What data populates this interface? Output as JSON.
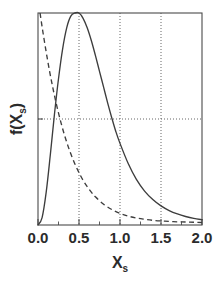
{
  "figure": {
    "background_color": "#ffffff",
    "line_color": "#3d3d3d",
    "grid_color": "#555555"
  },
  "axes": {
    "x_title_main": "X",
    "x_title_sub": "s",
    "y_title_prefix": "f(X",
    "y_title_sub": "s",
    "y_title_suffix": ")",
    "x_tick_labels": [
      "0.0",
      "0.5",
      "1.0",
      "1.5",
      "2.0"
    ],
    "x_tick_values": [
      0.0,
      0.5,
      1.0,
      1.5,
      2.0
    ],
    "y_tick_labels": []
  },
  "chart_data": {
    "type": "line",
    "title": "",
    "xlabel": "X_s",
    "ylabel": "f(X_s)",
    "xlim": [
      0.0,
      2.0
    ],
    "ylim": [
      0.0,
      1.0
    ],
    "grid": true,
    "grid_x_values": [
      0.5,
      1.0,
      1.5
    ],
    "grid_y_values": [
      0.5
    ],
    "legend": "none",
    "x_tick_labels": [
      "0.0",
      "0.5",
      "1.0",
      "1.5",
      "2.0"
    ],
    "y_tick_labels": [],
    "annotations": [],
    "series": [
      {
        "name": "solid-curve",
        "style": "solid",
        "description": "unimodal skewed distribution peaking at X_s = 0.5",
        "x": [
          0.0,
          0.05,
          0.1,
          0.15,
          0.2,
          0.25,
          0.3,
          0.35,
          0.4,
          0.45,
          0.5,
          0.55,
          0.6,
          0.65,
          0.7,
          0.75,
          0.8,
          0.85,
          0.9,
          0.95,
          1.0,
          1.1,
          1.2,
          1.3,
          1.4,
          1.5,
          1.6,
          1.7,
          1.8,
          1.9,
          2.0
        ],
        "y": [
          0.0,
          0.035,
          0.155,
          0.33,
          0.52,
          0.69,
          0.83,
          0.93,
          0.985,
          1.0,
          1.0,
          0.975,
          0.93,
          0.87,
          0.8,
          0.725,
          0.65,
          0.575,
          0.505,
          0.44,
          0.385,
          0.29,
          0.215,
          0.16,
          0.12,
          0.09,
          0.068,
          0.052,
          0.04,
          0.031,
          0.025
        ]
      },
      {
        "name": "dashed-curve",
        "style": "dashed",
        "description": "monotonically decaying exponential-like curve from upper left",
        "x": [
          0.025,
          0.05,
          0.08,
          0.11,
          0.14,
          0.17,
          0.2,
          0.24,
          0.28,
          0.32,
          0.36,
          0.4,
          0.45,
          0.5,
          0.55,
          0.6,
          0.65,
          0.7,
          0.8,
          0.9,
          1.0,
          1.1,
          1.2,
          1.3,
          1.4,
          1.5,
          1.6,
          1.7,
          1.8,
          1.9,
          2.0
        ],
        "y": [
          1.0,
          0.935,
          0.862,
          0.793,
          0.728,
          0.668,
          0.612,
          0.544,
          0.483,
          0.428,
          0.379,
          0.336,
          0.288,
          0.247,
          0.211,
          0.181,
          0.155,
          0.133,
          0.098,
          0.073,
          0.055,
          0.042,
          0.033,
          0.027,
          0.022,
          0.019,
          0.017,
          0.015,
          0.014,
          0.013,
          0.012
        ]
      }
    ]
  }
}
